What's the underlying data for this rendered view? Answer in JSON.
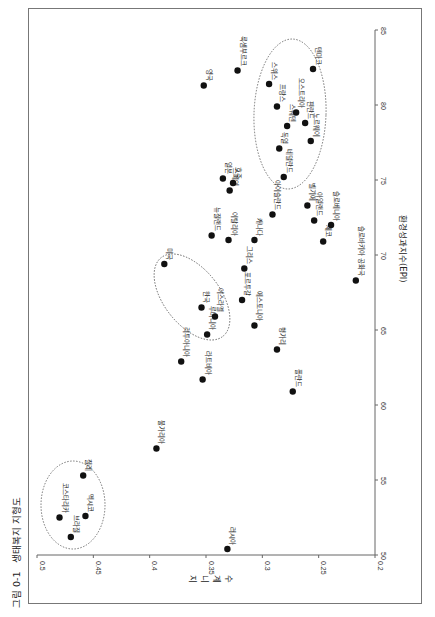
{
  "figure": {
    "number": "그림 0-1",
    "title": "생태복지 지형도"
  },
  "chart_data": {
    "type": "scatter",
    "orientation": "rotated 90° counter-clockwise (Gini on horizontal bottom axis, EPI on vertical right axis)",
    "xlabel": "환경성과지수(EPI)",
    "ylabel": "지니계수",
    "xlim": [
      50,
      85
    ],
    "ylim": [
      0.2,
      0.5
    ],
    "x_ticks": [
      50,
      55,
      60,
      65,
      70,
      75,
      80,
      85
    ],
    "y_ticks": [
      "0.5",
      "0.45",
      "0.4",
      "0.35",
      "0.3",
      "0.25",
      "0.2"
    ],
    "grid": false,
    "legend": null,
    "points": [
      {
        "label": "코스타리카",
        "epi": 52.5,
        "gini": 0.48
      },
      {
        "label": "브라질",
        "epi": 51.2,
        "gini": 0.47
      },
      {
        "label": "멕시코",
        "epi": 52.6,
        "gini": 0.457
      },
      {
        "label": "칠레",
        "epi": 55.3,
        "gini": 0.459
      },
      {
        "label": "불가리아",
        "epi": 57.1,
        "gini": 0.394
      },
      {
        "label": "러시아",
        "epi": 50.4,
        "gini": 0.331
      },
      {
        "label": "폴란드",
        "epi": 60.9,
        "gini": 0.273
      },
      {
        "label": "라트비아",
        "epi": 61.7,
        "gini": 0.353
      },
      {
        "label": "리투아니아",
        "epi": 62.9,
        "gini": 0.372
      },
      {
        "label": "헝가리",
        "epi": 63.7,
        "gini": 0.287
      },
      {
        "label": "루마니아",
        "epi": 64.7,
        "gini": 0.349
      },
      {
        "label": "에스토니아",
        "epi": 65.3,
        "gini": 0.307
      },
      {
        "label": "이스라엘",
        "epi": 65.9,
        "gini": 0.342
      },
      {
        "label": "한국",
        "epi": 66.5,
        "gini": 0.354
      },
      {
        "label": "포르투갈",
        "epi": 67.0,
        "gini": 0.318
      },
      {
        "label": "슬로바키아 공화국",
        "epi": 68.3,
        "gini": 0.217
      },
      {
        "label": "그리스",
        "epi": 69.1,
        "gini": 0.316
      },
      {
        "label": "미국",
        "epi": 69.4,
        "gini": 0.387
      },
      {
        "label": "캐나다",
        "epi": 71.0,
        "gini": 0.307
      },
      {
        "label": "이탈리아",
        "epi": 71.0,
        "gini": 0.33
      },
      {
        "label": "뉴질랜드",
        "epi": 71.3,
        "gini": 0.345
      },
      {
        "label": "체코",
        "epi": 70.9,
        "gini": 0.246
      },
      {
        "label": "슬로베니아",
        "epi": 72.0,
        "gini": 0.239
      },
      {
        "label": "아일랜드",
        "epi": 72.3,
        "gini": 0.254
      },
      {
        "label": "아이슬란드",
        "epi": 72.7,
        "gini": 0.291
      },
      {
        "label": "벨기에",
        "epi": 73.3,
        "gini": 0.26
      },
      {
        "label": "스페인",
        "epi": 74.3,
        "gini": 0.329
      },
      {
        "label": "호주",
        "epi": 74.8,
        "gini": 0.326
      },
      {
        "label": "일본",
        "epi": 75.1,
        "gini": 0.335
      },
      {
        "label": "네덜란드",
        "epi": 75.2,
        "gini": 0.281
      },
      {
        "label": "독일",
        "epi": 77.1,
        "gini": 0.285
      },
      {
        "label": "노르웨이",
        "epi": 77.6,
        "gini": 0.257
      },
      {
        "label": "스웨덴",
        "epi": 78.6,
        "gini": 0.278
      },
      {
        "label": "핀란드",
        "epi": 78.8,
        "gini": 0.262
      },
      {
        "label": "오스트리아",
        "epi": 79.5,
        "gini": 0.27
      },
      {
        "label": "프랑스",
        "epi": 79.9,
        "gini": 0.287
      },
      {
        "label": "영국",
        "epi": 81.3,
        "gini": 0.352
      },
      {
        "label": "스위스",
        "epi": 81.4,
        "gini": 0.294
      },
      {
        "label": "룩셈부르크",
        "epi": 82.3,
        "gini": 0.322
      },
      {
        "label": "덴마크",
        "epi": 82.4,
        "gini": 0.255
      }
    ],
    "annotations": [
      {
        "type": "dotted-ellipse",
        "group": [
          "코스타리카",
          "브라질",
          "멕시코",
          "칠레"
        ]
      },
      {
        "type": "dotted-ellipse",
        "group": [
          "미국",
          "한국",
          "이스라엘",
          "루마니아"
        ]
      },
      {
        "type": "dotted-ellipse",
        "group": [
          "스위스",
          "프랑스",
          "오스트리아",
          "스웨덴",
          "덴마크",
          "핀란드",
          "노르웨이",
          "독일",
          "네덜란드"
        ]
      }
    ]
  },
  "colors": {
    "point": "#111111",
    "axis": "#666666",
    "ellipse": "#555555",
    "frame": "#777777"
  }
}
